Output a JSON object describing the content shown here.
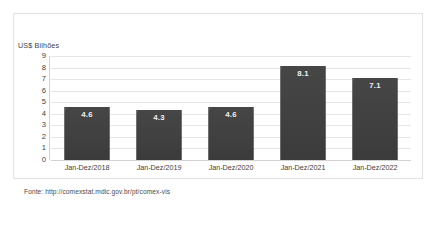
{
  "chart_data": {
    "type": "bar",
    "title": "",
    "subtitle": "",
    "xlabel": "",
    "ylabel": "US$ Bilhões",
    "ylim": [
      0,
      9
    ],
    "ytick_labels": [
      "9",
      "8",
      "7",
      "6",
      "5",
      "4",
      "3",
      "2",
      "1",
      "0"
    ],
    "grid": true,
    "legend": false,
    "categories": [
      "Jan-Dez/2018",
      "Jan-Dez/2019",
      "Jan-Dez/2020",
      "Jan-Dez/2021",
      "Jan-Dez/2022"
    ],
    "values": [
      4.6,
      4.3,
      4.6,
      8.1,
      7.1
    ],
    "value_labels": [
      "4.6",
      "4.3",
      "4.6",
      "8.1",
      "7.1"
    ],
    "bar_color": "#434343",
    "value_label_color": "#f2f2f2",
    "gridline_color": "#e6e6e6"
  },
  "footer": {
    "source": "Fonte: http://comexstat.mdic.gov.br/pt/comex-vis"
  }
}
